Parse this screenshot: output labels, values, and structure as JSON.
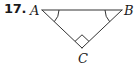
{
  "problem": {
    "number": "17."
  },
  "figure": {
    "type": "right-triangle",
    "vertices": {
      "A": {
        "label": "A",
        "x": 42,
        "y": 10
      },
      "B": {
        "label": "B",
        "x": 122,
        "y": 10
      },
      "C": {
        "label": "C",
        "x": 82,
        "y": 48
      }
    },
    "right_angle_at": "C",
    "congruent_angle_marks": [
      "A",
      "B"
    ],
    "colors": {
      "stroke": "#333333",
      "text": "#1a1a1a",
      "background": "#ffffff"
    }
  }
}
